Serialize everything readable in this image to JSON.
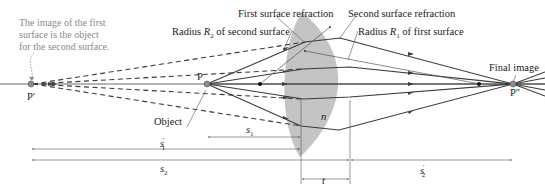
{
  "annotation_note": {
    "line1": "The image of the first",
    "line2": "surface is the object",
    "line3": "for the second surface."
  },
  "labels": {
    "first_surface_refraction": "First surface refraction",
    "second_surface_refraction": "Second surface refraction",
    "radius_r2_prefix": "Radius ",
    "radius_r2_var": "R",
    "radius_r2_sub": "2",
    "radius_r2_suffix": " of second surface",
    "radius_r1_prefix": "Radius ",
    "radius_r1_var": "R",
    "radius_r1_sub": "1",
    "radius_r1_suffix": " of first surface",
    "final_image": "Final image",
    "object": "Object",
    "lens_index": "n"
  },
  "points": {
    "p_prime": "P′",
    "p": "P",
    "p_double_prime": "P″"
  },
  "dimensions": {
    "s1": {
      "var": "s",
      "sub": "1",
      "prime": ""
    },
    "s1_prime": {
      "var": "s",
      "sub": "1",
      "prime": "′"
    },
    "s2": {
      "var": "s",
      "sub": "2",
      "prime": ""
    },
    "s2_prime": {
      "var": "s",
      "sub": "2",
      "prime": "′"
    },
    "t": {
      "var": "t"
    }
  },
  "colors": {
    "lens_fill": "#c4c4c4",
    "ray": "#3a3a3a",
    "virtual_ray": "#3a3a3a",
    "radius_line": "#555555",
    "axis": "#444444",
    "point_fill": "#8c8c8c",
    "annotation": "#8a8a8a"
  }
}
